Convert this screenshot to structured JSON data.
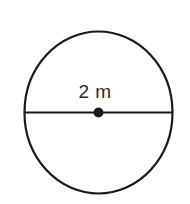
{
  "figure": {
    "kind": "circle-diagram",
    "label": "2 m",
    "dimension_value": "2",
    "dimension_unit": "m",
    "stroke_color": "#1a1a1a",
    "label_color": "#2b2b2b",
    "background_color": "#ffffff",
    "center_dot_color": "#1a1a1a",
    "geometry": {
      "center_x": 98.5,
      "center_y": 112.5,
      "radius_x": 74,
      "radius_y": 81,
      "stroke_width": 2.2,
      "dot_radius": 5,
      "diameter_line_y": 112.5,
      "diameter_line_x1": 24.5,
      "diameter_line_x2": 172.5
    }
  }
}
